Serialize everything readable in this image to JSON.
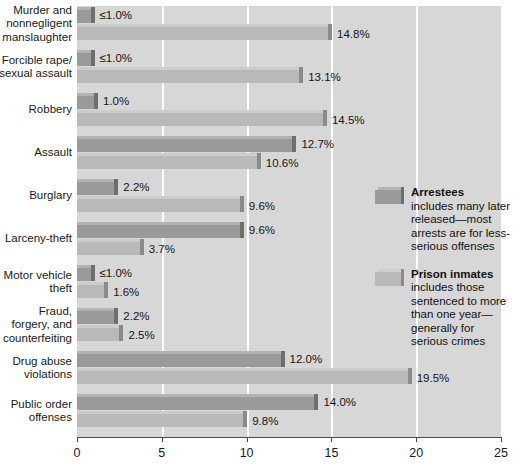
{
  "chart_data": {
    "type": "bar",
    "orientation": "horizontal",
    "title": "",
    "xlabel": "",
    "ylabel": "",
    "xlim": [
      0,
      25
    ],
    "xticks": [
      "0",
      "5",
      "10",
      "15",
      "20",
      "25"
    ],
    "grid": true,
    "legend_position": "right-middle",
    "categories": [
      "Murder and nonnegligent manslaughter",
      "Forcible rape/ sexual assault",
      "Robbery",
      "Assault",
      "Burglary",
      "Larceny-theft",
      "Motor vehicle theft",
      "Fraud, forgery, and counterfeiting",
      "Drug abuse violations",
      "Public order offenses"
    ],
    "category_lines": [
      [
        "Murder and",
        "nonnegligent",
        "manslaughter"
      ],
      [
        "Forcible rape/",
        "sexual assault"
      ],
      [
        "Robbery"
      ],
      [
        "Assault"
      ],
      [
        "Burglary"
      ],
      [
        "Larceny-theft"
      ],
      [
        "Motor vehicle",
        "theft"
      ],
      [
        "Fraud,",
        "forgery, and",
        "counterfeiting"
      ],
      [
        "Drug abuse",
        "violations"
      ],
      [
        "Public order",
        "offenses"
      ]
    ],
    "series": [
      {
        "name": "Arrestees",
        "color": "#9a9a9a",
        "values": [
          0.8,
          0.8,
          1.0,
          12.7,
          2.2,
          9.6,
          0.8,
          2.2,
          12.0,
          14.0
        ],
        "labels": [
          "≤1.0%",
          "≤1.0%",
          "1.0%",
          "12.7%",
          "2.2%",
          "9.6%",
          "≤1.0%",
          "2.2%",
          "12.0%",
          "14.0%"
        ]
      },
      {
        "name": "Prison inmates",
        "color": "#b9b9b9",
        "values": [
          14.8,
          13.1,
          14.5,
          10.6,
          9.6,
          3.7,
          1.6,
          2.5,
          19.5,
          9.8
        ],
        "labels": [
          "14.8%",
          "13.1%",
          "14.5%",
          "10.6%",
          "9.6%",
          "3.7%",
          "1.6%",
          "2.5%",
          "19.5%",
          "9.8%"
        ]
      }
    ]
  },
  "legend": {
    "entries": [
      {
        "title": "Arrestees",
        "description": "includes many later released—most arrests are for less-serious offenses",
        "lines": [
          "includes many later",
          "released—most",
          "arrests are for less-",
          "serious offenses"
        ]
      },
      {
        "title": "Prison inmates",
        "description": "includes those sentenced to more than one year—generally for serious crimes",
        "lines": [
          "includes those",
          "sentenced to more",
          "than one year—",
          "generally for",
          "serious crimes"
        ]
      }
    ]
  },
  "colors": {
    "plot_background": "#d7d7d7",
    "gridline": "#ffffff",
    "arrestee_bar": "#9a9a9a",
    "inmate_bar": "#b9b9b9",
    "axis": "#4a4a4a",
    "text": "#1a1a1a"
  }
}
